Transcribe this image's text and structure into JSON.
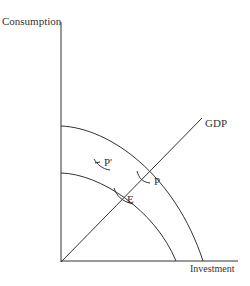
{
  "diagram": {
    "axes": {
      "y_label": "Consumption",
      "x_label": "Investment"
    },
    "lines": {
      "gdp_label": "GDP"
    },
    "points": {
      "p_prime": "P'",
      "p": "P",
      "e": "E"
    },
    "colors": {
      "stroke": "#333333",
      "background": "#ffffff"
    }
  }
}
